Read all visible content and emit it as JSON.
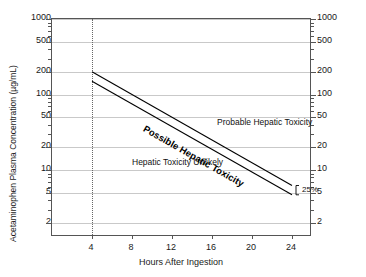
{
  "chart_data": {
    "type": "line",
    "title": "",
    "xlabel": "Hours After Ingestion",
    "ylabel": "Acetaminophen Plasma Concentration (µg/mL)",
    "yscale": "log",
    "ylim": [
      1.3,
      1000
    ],
    "xlim": [
      0,
      26
    ],
    "grid": true,
    "legend_position": "none",
    "y_ticks_left": [
      "1000",
      "500",
      "200",
      "100",
      "50",
      "20",
      "10",
      "5",
      "2"
    ],
    "y_ticks_right": [
      "1000",
      "500",
      "200",
      "100",
      "50",
      "20",
      "10",
      "5",
      "2"
    ],
    "y_tick_values": [
      1000,
      500,
      200,
      100,
      50,
      20,
      10,
      5,
      2
    ],
    "x_ticks": [
      "4",
      "8",
      "12",
      "16",
      "20",
      "24"
    ],
    "x_tick_values": [
      4,
      8,
      12,
      16,
      20,
      24
    ],
    "series": [
      {
        "name": "Upper treatment line (200 µg/mL at 4 h)",
        "x": [
          4,
          24
        ],
        "values": [
          200,
          6.25
        ]
      },
      {
        "name": "Lower treatment line (25% below, 150 µg/mL at 4 h)",
        "x": [
          4,
          24
        ],
        "values": [
          150,
          4.7
        ]
      }
    ],
    "reference_lines": [
      {
        "name": "4-hour marker",
        "orientation": "vertical",
        "value": 4,
        "style": "dotted"
      }
    ],
    "annotations": [
      {
        "name": "probable-region",
        "text": "Probable Hepatic Toxicity",
        "x": 16.5,
        "y": 44
      },
      {
        "name": "unlikely-region",
        "text": "Hepatic Toxicity Unlikely",
        "x": 8.0,
        "y": 13
      },
      {
        "name": "possible-band",
        "text": "Possible Hepatic Toxicity",
        "x": 9.5,
        "y": 42,
        "rotated": true,
        "bold": true
      },
      {
        "name": "percent-gap",
        "text": "25%",
        "x": 24.8,
        "y": 5.2
      }
    ]
  },
  "labels": {
    "y_axis_title": "Acetaminophen Plasma Concentration (µg/mL)",
    "x_axis_title": "Hours After Ingestion",
    "region_probable": "Probable Hepatic Toxicity",
    "region_unlikely": "Hepatic Toxicity Unlikely",
    "band_possible": "Possible Hepatic Toxicity",
    "percent_gap": "25%"
  },
  "colors": {
    "background": "#ffffff",
    "axis": "#555555",
    "gridline": "#c9c9c9",
    "line": "#000000",
    "text": "#1a1a1a",
    "dotted_marker": "#666666"
  }
}
